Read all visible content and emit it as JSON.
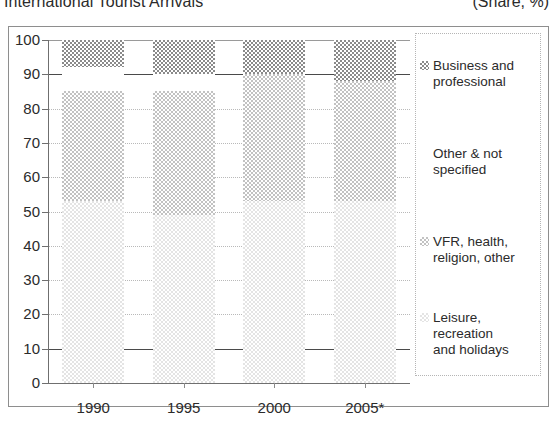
{
  "header": {
    "title": "International Tourist Arrivals",
    "units": "(Share, %)"
  },
  "chart_data": {
    "type": "bar",
    "subtype": "stacked-column",
    "title": "International Tourist Arrivals",
    "units": "(Share, %)",
    "xlabel": "",
    "ylabel": "",
    "ylim": [
      0,
      100
    ],
    "yticks": [
      0,
      10,
      20,
      30,
      40,
      50,
      60,
      70,
      80,
      90,
      100
    ],
    "grid": true,
    "legend_position": "right",
    "categories": [
      "1990",
      "1995",
      "2000",
      "2005*"
    ],
    "series": [
      {
        "name": "Leisure, recreation and holidays",
        "swatch": "leisure",
        "color": "#e4e4e4",
        "values": [
          53,
          49,
          53,
          53
        ]
      },
      {
        "name": "VFR, health, religion, other",
        "swatch": "vfr",
        "color": "#c2c2c2",
        "values": [
          32,
          36,
          37,
          35
        ]
      },
      {
        "name": "Other & not specified",
        "swatch": "other",
        "color": "#ffffff",
        "values": [
          7,
          5,
          0,
          0
        ]
      },
      {
        "name": "Business and professional",
        "swatch": "business",
        "color": "#8a8a8a",
        "values": [
          8,
          10,
          10,
          12
        ]
      }
    ]
  },
  "yaxis": {
    "ticks": [
      "100",
      "90",
      "80",
      "70",
      "60",
      "50",
      "40",
      "30",
      "20",
      "10",
      "0"
    ]
  },
  "xaxis": {
    "labels": [
      "1990",
      "1995",
      "2000",
      "2005*"
    ]
  },
  "legend": {
    "items": [
      {
        "label_line1": "Business and",
        "label_line2": "professional",
        "swatch": "business"
      },
      {
        "label_line1": "Other & not",
        "label_line2": "specified",
        "swatch": "other"
      },
      {
        "label_line1": "VFR, health,",
        "label_line2": "religion, other",
        "swatch": "vfr"
      },
      {
        "label_line1": "Leisure, recreation",
        "label_line2": "and holidays",
        "swatch": "leisure"
      }
    ]
  }
}
